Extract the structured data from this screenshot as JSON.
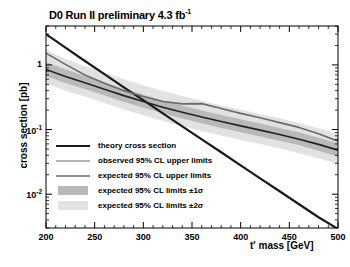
{
  "chart_data": {
    "type": "line",
    "title": "D0 Run II preliminary 4.3 fb",
    "title_sup": "-1",
    "xlabel": "t' mass [GeV]",
    "ylabel": "cross section [pb]",
    "xlim": [
      200,
      500
    ],
    "ylim": [
      0.003,
      4.0
    ],
    "yscale": "log",
    "xscale": "linear",
    "grid": false,
    "legend_position": "lower-left-inside",
    "xticks": [
      200,
      250,
      300,
      350,
      400,
      450,
      500
    ],
    "xtick_labels": [
      "200",
      "250",
      "300",
      "350",
      "400",
      "450",
      "500"
    ],
    "yticks": [
      1,
      0.1,
      0.01
    ],
    "ytick_labels": [
      "1",
      "10",
      "10"
    ],
    "ytick_sups": [
      "",
      "-1",
      "-2"
    ],
    "x": [
      200,
      220,
      240,
      260,
      280,
      300,
      320,
      340,
      360,
      380,
      400,
      420,
      440,
      460,
      480,
      500
    ],
    "series": [
      {
        "name": "theory cross section",
        "color": "#1a1a1a",
        "width": 2.2,
        "values": [
          3.0,
          1.85,
          1.15,
          0.72,
          0.45,
          0.285,
          0.178,
          0.112,
          0.0705,
          0.0445,
          0.0279,
          0.0176,
          0.0111,
          0.007,
          0.0044,
          0.0029
        ]
      },
      {
        "name": "observed 95% CL upper limits",
        "color": "#6b6b6b",
        "width": 1.6,
        "values": [
          1.52,
          1.02,
          0.7,
          0.52,
          0.4,
          0.325,
          0.272,
          0.25,
          0.252,
          0.212,
          0.178,
          0.152,
          0.128,
          0.108,
          0.086,
          0.066
        ]
      },
      {
        "name": "expected 95% CL upper limits",
        "color": "#222222",
        "width": 1.6,
        "values": [
          0.85,
          0.66,
          0.53,
          0.42,
          0.335,
          0.272,
          0.222,
          0.185,
          0.156,
          0.133,
          0.114,
          0.098,
          0.084,
          0.071,
          0.059,
          0.048
        ]
      }
    ],
    "bands": [
      {
        "name": "expected 95% CL limits ±2σ",
        "color": "#e2e2e2",
        "lower": [
          0.52,
          0.4,
          0.325,
          0.258,
          0.205,
          0.166,
          0.136,
          0.113,
          0.095,
          0.081,
          0.069,
          0.06,
          0.051,
          0.043,
          0.036,
          0.029
        ],
        "upper": [
          1.7,
          1.24,
          0.96,
          0.76,
          0.6,
          0.485,
          0.395,
          0.33,
          0.278,
          0.236,
          0.202,
          0.174,
          0.149,
          0.126,
          0.105,
          0.086
        ]
      },
      {
        "name": "expected 95% CL limits ±1σ",
        "color": "#b9b9b9",
        "lower": [
          0.67,
          0.525,
          0.425,
          0.337,
          0.268,
          0.218,
          0.178,
          0.148,
          0.125,
          0.106,
          0.091,
          0.078,
          0.067,
          0.057,
          0.047,
          0.038
        ],
        "upper": [
          1.1,
          0.86,
          0.675,
          0.535,
          0.425,
          0.345,
          0.282,
          0.235,
          0.198,
          0.168,
          0.144,
          0.124,
          0.106,
          0.09,
          0.075,
          0.061
        ]
      }
    ],
    "legend": [
      {
        "label": "theory cross section",
        "kind": "line",
        "color": "#1a1a1a",
        "width": 2.4
      },
      {
        "label": "observed 95% CL upper limits",
        "kind": "line",
        "color": "#6b6b6b",
        "width": 1.7
      },
      {
        "label": "expected 95% CL upper limits",
        "kind": "line",
        "color": "#222222",
        "width": 1.7
      },
      {
        "label": "expected 95% CL limits ±1σ",
        "kind": "patch",
        "color": "#b9b9b9",
        "width": 0
      },
      {
        "label": "expected 95% CL limits ±2σ",
        "kind": "patch",
        "color": "#e2e2e2",
        "width": 0
      }
    ],
    "axis_color": "#000000",
    "frame": {
      "left": 46,
      "right": 338,
      "top": 26,
      "bottom": 228
    }
  }
}
